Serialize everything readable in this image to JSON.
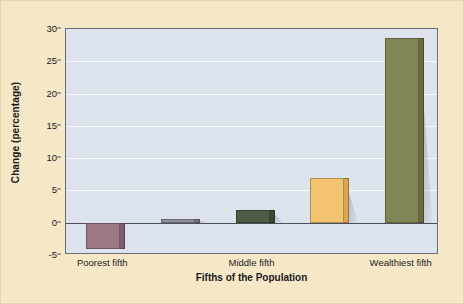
{
  "figure": {
    "background_color": "#f6e8c6",
    "plot_background_color": "#dde3ec",
    "gridline_color": "#f4f7fb",
    "axis_color": "#6a6d78"
  },
  "chart_data": {
    "type": "bar",
    "title": "",
    "xlabel": "Fifths of the Population",
    "ylabel": "Change (percentage)",
    "categories": [
      "Poorest fifth",
      "Second fifth",
      "Middle fifth",
      "Fourth fifth",
      "Wealthiest fifth"
    ],
    "visible_tick_labels": [
      "Poorest fifth",
      "Middle fifth",
      "Wealthiest fifth"
    ],
    "values": [
      -4.0,
      0.5,
      2.0,
      7.0,
      28.6
    ],
    "ylim": [
      -5,
      30
    ],
    "yticks": [
      -5,
      0,
      5,
      10,
      15,
      20,
      25,
      30
    ],
    "ytick_labels": [
      "-5",
      "0",
      "5",
      "10",
      "15",
      "20",
      "25",
      "30"
    ],
    "grid": "horizontal",
    "legend": "none",
    "bar_colors": [
      "#9c7885",
      "#8a9099",
      "#4e5c45",
      "#f2c471",
      "#828656"
    ],
    "bar_side_colors": [
      "#7e5d69",
      "#6f757e",
      "#3a4734",
      "#d7a84f",
      "#696d41"
    ]
  }
}
